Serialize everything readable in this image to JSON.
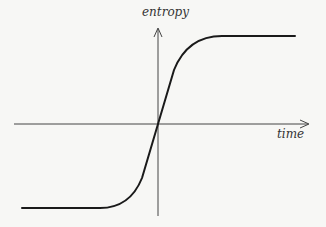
{
  "diagram": {
    "type": "sigmoid-curve",
    "axes": {
      "x_label": "time",
      "y_label": "entropy"
    },
    "colors": {
      "background": "#f7f7f5",
      "axis": "#444444",
      "curve": "#1a1a1a",
      "text": "#333333"
    },
    "curve_description": "S-shaped curve: flat low plateau, steep rise through origin, flat high plateau"
  }
}
